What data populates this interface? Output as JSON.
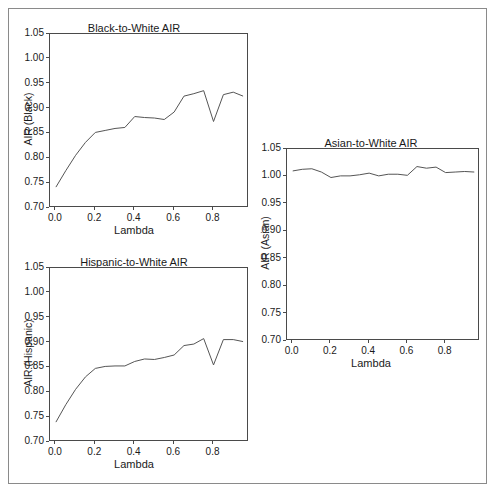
{
  "figure": {
    "background": "#ffffff",
    "border_color": "#8a8a8a",
    "line_color": "#555555",
    "axis_color": "#4a4a4a"
  },
  "chart_data": [
    {
      "id": "black",
      "type": "line",
      "title": "Black-to-White AIR",
      "xlabel": "Lambda",
      "ylabel": "AIR (Black)",
      "xlim": [
        -0.03,
        0.98
      ],
      "ylim": [
        0.7,
        1.05
      ],
      "xticks": [
        "0.0",
        "0.2",
        "0.4",
        "0.6",
        "0.8"
      ],
      "xtick_values": [
        0.0,
        0.2,
        0.4,
        0.6,
        0.8
      ],
      "yticks": [
        "0.70",
        "0.75",
        "0.80",
        "0.85",
        "0.90",
        "0.95",
        "1.00",
        "1.05"
      ],
      "ytick_values": [
        0.7,
        0.75,
        0.8,
        0.85,
        0.9,
        0.95,
        1.0,
        1.05
      ],
      "grid": false,
      "legend": "none",
      "x": [
        0.0,
        0.05,
        0.1,
        0.15,
        0.2,
        0.25,
        0.3,
        0.35,
        0.4,
        0.45,
        0.5,
        0.55,
        0.6,
        0.65,
        0.7,
        0.75,
        0.8,
        0.85,
        0.9,
        0.95
      ],
      "values": [
        0.742,
        0.775,
        0.806,
        0.832,
        0.852,
        0.856,
        0.86,
        0.862,
        0.884,
        0.882,
        0.881,
        0.878,
        0.893,
        0.925,
        0.93,
        0.936,
        0.874,
        0.928,
        0.933,
        0.925
      ]
    },
    {
      "id": "hispanic",
      "type": "line",
      "title": "Hispanic-to-White AIR",
      "xlabel": "Lambda",
      "ylabel": "AIR (Hispanic)",
      "xlim": [
        -0.03,
        0.98
      ],
      "ylim": [
        0.7,
        1.05
      ],
      "xticks": [
        "0.0",
        "0.2",
        "0.4",
        "0.6",
        "0.8"
      ],
      "xtick_values": [
        0.0,
        0.2,
        0.4,
        0.6,
        0.8
      ],
      "yticks": [
        "0.70",
        "0.75",
        "0.80",
        "0.85",
        "0.90",
        "0.95",
        "1.00",
        "1.05"
      ],
      "ytick_values": [
        0.7,
        0.75,
        0.8,
        0.85,
        0.9,
        0.95,
        1.0,
        1.05
      ],
      "grid": false,
      "legend": "none",
      "x": [
        0.0,
        0.05,
        0.1,
        0.15,
        0.2,
        0.25,
        0.3,
        0.35,
        0.4,
        0.45,
        0.5,
        0.55,
        0.6,
        0.65,
        0.7,
        0.75,
        0.8,
        0.85,
        0.9,
        0.95
      ],
      "values": [
        0.74,
        0.775,
        0.806,
        0.831,
        0.848,
        0.852,
        0.853,
        0.853,
        0.862,
        0.867,
        0.866,
        0.87,
        0.875,
        0.894,
        0.897,
        0.908,
        0.855,
        0.906,
        0.906,
        0.902
      ]
    },
    {
      "id": "asian",
      "type": "line",
      "title": "Asian-to-White AIR",
      "xlabel": "Lambda",
      "ylabel": "AIR (Asian)",
      "xlim": [
        -0.03,
        0.98
      ],
      "ylim": [
        0.7,
        1.05
      ],
      "xticks": [
        "0.0",
        "0.2",
        "0.4",
        "0.6",
        "0.8"
      ],
      "xtick_values": [
        0.0,
        0.2,
        0.4,
        0.6,
        0.8
      ],
      "yticks": [
        "0.70",
        "0.75",
        "0.80",
        "0.85",
        "0.90",
        "0.95",
        "1.00",
        "1.05"
      ],
      "ytick_values": [
        0.7,
        0.75,
        0.8,
        0.85,
        0.9,
        0.95,
        1.0,
        1.05
      ],
      "grid": false,
      "legend": "none",
      "x": [
        0.0,
        0.05,
        0.1,
        0.15,
        0.2,
        0.25,
        0.3,
        0.35,
        0.4,
        0.45,
        0.5,
        0.55,
        0.6,
        0.65,
        0.7,
        0.75,
        0.8,
        0.85,
        0.9,
        0.95
      ],
      "values": [
        1.01,
        1.013,
        1.014,
        1.008,
        0.998,
        1.001,
        1.001,
        1.003,
        1.006,
        1.001,
        1.004,
        1.004,
        1.002,
        1.018,
        1.015,
        1.017,
        1.007,
        1.008,
        1.009,
        1.008
      ]
    }
  ]
}
